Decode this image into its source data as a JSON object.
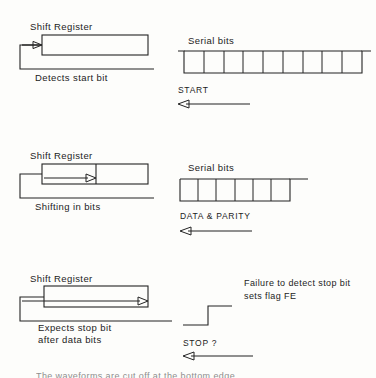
{
  "document": {
    "kind": "technical-diagram",
    "subject": "UART serial reception: start bit, data and parity bits, stop bit",
    "ink_color": "#232323",
    "background_color": "#fdfdfb"
  },
  "panels": [
    {
      "id": "start",
      "register_title": "Shift  Register",
      "caption": "Detects start bit",
      "waveform_title": "Serial  bits",
      "signal_label": "START",
      "arrow_direction": "left",
      "waveform": {
        "type": "digital-timing",
        "description": "line idles high, drops low for a framed run of bit cells, then returns high",
        "segments": [
          "high",
          "low",
          "high"
        ],
        "bit_cells": 9,
        "tick_count": 8
      },
      "register": {
        "style": "empty-box",
        "inner_arrow": "small-entry-arrow",
        "feedback_loop": true
      }
    },
    {
      "id": "data",
      "register_title": "Shift  Register",
      "caption": "Shifting  in  bits",
      "waveform_title": "Serial  bits",
      "signal_label": "DATA  &  PARITY",
      "arrow_direction": "left",
      "waveform": {
        "type": "digital-timing",
        "description": "line is low across a framed run of bit cells, then steps up to high",
        "segments": [
          "low",
          "high"
        ],
        "bit_cells": 6,
        "tick_count": 5
      },
      "register": {
        "style": "partitioned-box",
        "partition_fraction": 0.55,
        "inner_arrow": "shift-arrow",
        "feedback_loop": true
      }
    },
    {
      "id": "stop",
      "register_title": "Shift  Register",
      "caption_line1": "Expects  stop  bit",
      "caption_line2": "after  data  bits",
      "signal_label": "STOP  ?",
      "note_line1": "Failure  to  detect  stop  bit",
      "note_line2": "sets  flag  FE",
      "arrow_direction": "left",
      "waveform": {
        "type": "digital-timing",
        "description": "single rising edge: low then high",
        "segments": [
          "low",
          "high"
        ],
        "bit_cells": 0,
        "tick_count": 0
      },
      "register": {
        "style": "full-arrow-box",
        "inner_arrow": "full-width-arrow",
        "feedback_loop": true
      }
    }
  ],
  "bottom_caption": "The waveforms are cut off at the bottom edge"
}
